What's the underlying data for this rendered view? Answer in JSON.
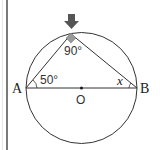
{
  "diagram": {
    "points": {
      "A": {
        "label": "A"
      },
      "B": {
        "label": "B"
      },
      "O": {
        "label": "O"
      }
    },
    "angles": {
      "top": "90°",
      "at_A": "50°",
      "at_B": "x"
    },
    "arrow_marker": "down-arrow",
    "colors": {
      "stroke": "#333333",
      "arrow": "#555555",
      "right_angle_marker": "#999999",
      "side_rule": "#7a7a7a"
    }
  }
}
